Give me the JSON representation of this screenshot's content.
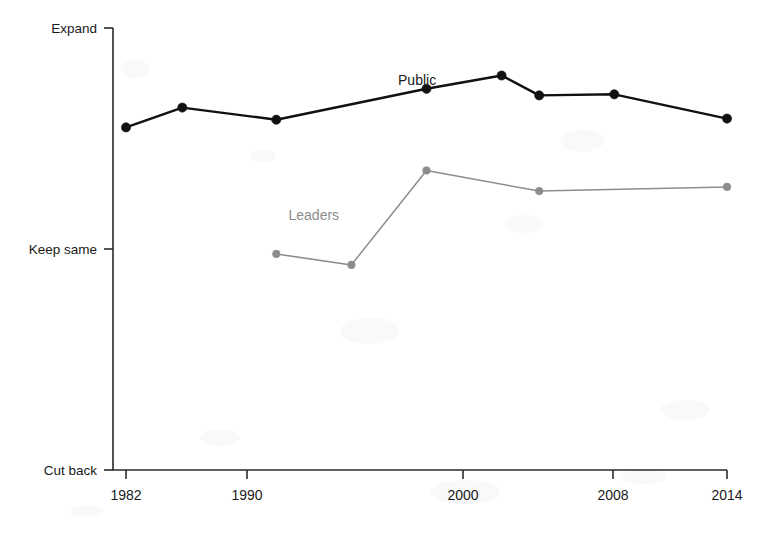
{
  "chart_data": {
    "type": "line",
    "title": "",
    "subtitle": "",
    "xlabel": "",
    "ylabel": "",
    "grid": false,
    "legend_position": "inline-annotation",
    "x_ticks": [
      1982,
      1990,
      2000,
      2008,
      2014
    ],
    "x_tick_labels": [
      "1982",
      "1990",
      "2000",
      "2008",
      "2014"
    ],
    "xlim": [
      1982,
      2014
    ],
    "y_ticks": [
      0,
      1,
      2
    ],
    "y_tick_labels": [
      "Cut back",
      "Keep same",
      "Expand"
    ],
    "ylim": [
      0,
      2
    ],
    "series": [
      {
        "name": "Public",
        "color": "#111111",
        "label_x": 1997.5,
        "label_y": 1.74,
        "x": [
          1982,
          1985,
          1990,
          1998,
          2002,
          2004,
          2008,
          2014
        ],
        "y": [
          1.55,
          1.64,
          1.585,
          1.725,
          1.785,
          1.695,
          1.7,
          1.59
        ]
      },
      {
        "name": "Leaders",
        "color": "#8c8c8c",
        "label_x": 1992.0,
        "label_y": 1.13,
        "x": [
          1990,
          1994,
          1998,
          2004,
          2014
        ],
        "y": [
          0.978,
          0.928,
          1.355,
          1.262,
          1.281
        ]
      }
    ],
    "annotations": [
      {
        "text": "Public",
        "series": "Public"
      },
      {
        "text": "Leaders",
        "series": "Leaders"
      }
    ]
  },
  "axes": {
    "y_labels": [
      {
        "text": "Expand"
      },
      {
        "text": "Keep same"
      },
      {
        "text": "Cut back"
      }
    ],
    "x_labels": [
      {
        "text": "1982"
      },
      {
        "text": "1990"
      },
      {
        "text": "2000"
      },
      {
        "text": "2008"
      },
      {
        "text": "2014"
      }
    ]
  },
  "geometry": {
    "plot_left": 113,
    "plot_right": 727,
    "plot_top": 28,
    "plot_bottom": 470,
    "x_tick_px": [
      126,
      247,
      463,
      613,
      727
    ],
    "y_tick_px": [
      28,
      249,
      470
    ]
  },
  "colors": {
    "public": "#111111",
    "leaders": "#8c8c8c",
    "axis": "#2b2b2b",
    "background": "#ffffff"
  }
}
